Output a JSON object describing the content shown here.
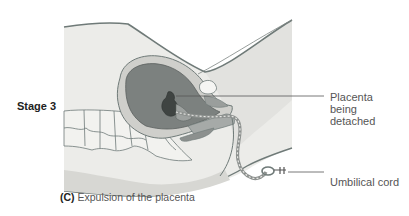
{
  "figure": {
    "stage_label": "Stage 3",
    "caption": {
      "letter": "(C)",
      "text": " Expulsion of the placenta"
    },
    "callouts": [
      {
        "id": "placenta",
        "lines": [
          "Placenta",
          "being",
          "detached"
        ]
      },
      {
        "id": "cord",
        "lines": [
          "Umbilical cord"
        ]
      }
    ],
    "colors": {
      "body_fill": "#e9e9e6",
      "body_outline": "#6f7a78",
      "uterus_wall": "#c9c9c5",
      "uterus_cavity": "#7c817f",
      "placenta_dark": "#4d5250",
      "vertebra_fill": "#f1f1ee",
      "leader_line": "#555555"
    }
  }
}
